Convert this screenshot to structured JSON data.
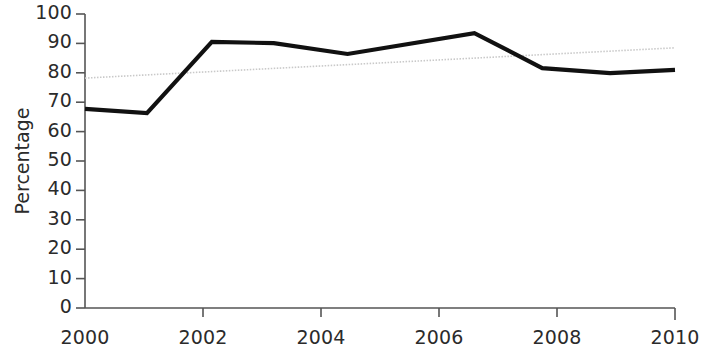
{
  "chart_data": {
    "type": "line",
    "title": "",
    "subtitle": "",
    "xlabel": "",
    "ylabel": "Percentage",
    "xlim": [
      2000,
      2010
    ],
    "ylim": [
      0,
      100
    ],
    "grid": false,
    "legend": null,
    "x_ticks": [
      "2000",
      "2002",
      "2004",
      "2006",
      "2008",
      "2010"
    ],
    "x_tick_values": [
      2000,
      2002,
      2004,
      2006,
      2008,
      2010
    ],
    "y_ticks": [
      "0",
      "10",
      "20",
      "30",
      "40",
      "50",
      "60",
      "70",
      "80",
      "90",
      "100"
    ],
    "y_tick_values": [
      0,
      10,
      20,
      30,
      40,
      50,
      60,
      70,
      80,
      90,
      100
    ],
    "series": [
      {
        "name": "Percentage",
        "style": "solid",
        "color": "#111111",
        "width": 4.2,
        "x": [
          2000.0,
          2001.05,
          2002.15,
          2003.2,
          2004.45,
          2006.6,
          2007.75,
          2008.9,
          2010.0
        ],
        "values": [
          67.7,
          66.3,
          90.5,
          90.1,
          86.4,
          93.5,
          81.6,
          79.9,
          81.0
        ]
      },
      {
        "name": "Trend line",
        "style": "dotted",
        "color": "#c9c9c9",
        "width": 1.6,
        "x": [
          2000.0,
          2010.0
        ],
        "values": [
          78.2,
          88.5
        ]
      }
    ]
  },
  "axis": {
    "y_label": "Percentage",
    "y_tick_labels": [
      "100",
      "90",
      "80",
      "70",
      "60",
      "50",
      "40",
      "30",
      "20",
      "10",
      "0"
    ],
    "x_tick_labels": [
      "2000",
      "2002",
      "2004",
      "2006",
      "2008",
      "2010"
    ]
  }
}
